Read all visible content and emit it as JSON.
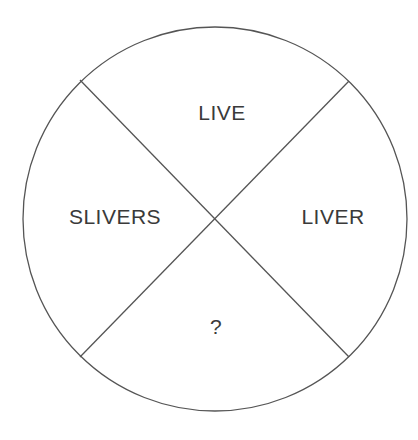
{
  "diagram": {
    "type": "circle divided into four quadrants by an X",
    "colors": {
      "stroke": "#555555",
      "text": "#3a3a3a",
      "background": "#ffffff"
    },
    "segments": {
      "top": "LIVE",
      "left": "SLIVERS",
      "right": "LIVER",
      "bottom": "?"
    }
  }
}
